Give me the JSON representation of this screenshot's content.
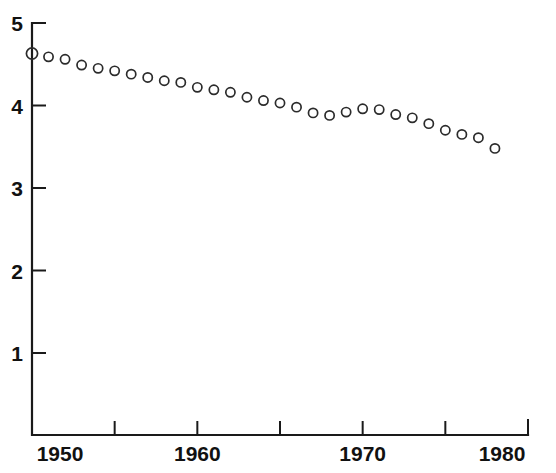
{
  "chart_data": {
    "type": "scatter",
    "title": "",
    "subtitle": "",
    "xlabel": "",
    "ylabel": "",
    "xlim": [
      1950,
      1980
    ],
    "ylim": [
      0,
      5
    ],
    "grid": false,
    "legend": null,
    "marker": "open-circle",
    "x_ticks": [
      1950,
      1955,
      1960,
      1965,
      1970,
      1975,
      1980
    ],
    "x_tick_labels": [
      "1950",
      "",
      "1960",
      "",
      "1970",
      "",
      "1980"
    ],
    "y_ticks": [
      1,
      2,
      3,
      4,
      5
    ],
    "y_tick_labels": [
      "1",
      "2",
      "3",
      "4",
      "5"
    ],
    "x": [
      1950,
      1951,
      1952,
      1953,
      1954,
      1955,
      1956,
      1957,
      1958,
      1959,
      1960,
      1961,
      1962,
      1963,
      1964,
      1965,
      1966,
      1967,
      1968,
      1969,
      1970,
      1971,
      1972,
      1973,
      1974,
      1975,
      1976,
      1977,
      1978
    ],
    "values": [
      4.63,
      4.59,
      4.56,
      4.49,
      4.45,
      4.42,
      4.38,
      4.34,
      4.3,
      4.28,
      4.22,
      4.19,
      4.16,
      4.1,
      4.06,
      4.03,
      3.98,
      3.91,
      3.88,
      3.92,
      3.96,
      3.95,
      3.89,
      3.85,
      3.78,
      3.7,
      3.65,
      3.61,
      3.48
    ]
  }
}
